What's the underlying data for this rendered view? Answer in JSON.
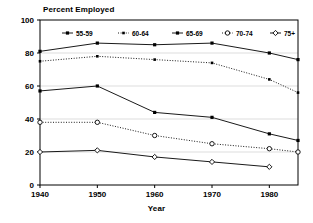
{
  "chart_data": {
    "type": "line",
    "title": "Percent Employed",
    "xlabel": "Year",
    "ylabel": "",
    "xlim": [
      1940,
      1985
    ],
    "ylim": [
      0,
      100
    ],
    "yticks": [
      0,
      20,
      40,
      60,
      80,
      100
    ],
    "xticks": [
      1940,
      1950,
      1960,
      1970,
      1980
    ],
    "grid": true,
    "legend_position": "top-inside",
    "x": [
      1940,
      1950,
      1960,
      1970,
      1980,
      1985
    ],
    "series": [
      {
        "name": "55-59",
        "marker": "filled-square",
        "linestyle": "solid",
        "color": "#000000",
        "values": [
          81,
          86,
          85,
          86,
          80,
          76
        ]
      },
      {
        "name": "60-64",
        "marker": "filled-square-small",
        "linestyle": "dotted",
        "color": "#000000",
        "values": [
          75,
          78,
          76,
          74,
          64,
          56
        ]
      },
      {
        "name": "65-69",
        "marker": "filled-square",
        "linestyle": "solid",
        "color": "#000000",
        "values": [
          57,
          60,
          44,
          41,
          31,
          27
        ]
      },
      {
        "name": "70-74",
        "marker": "open-circle",
        "linestyle": "dotted",
        "color": "#000000",
        "values": [
          38,
          38,
          30,
          25,
          22,
          20
        ]
      },
      {
        "name": "75+",
        "marker": "open-diamond",
        "linestyle": "solid",
        "color": "#000000",
        "values": [
          20,
          21,
          17,
          14,
          11,
          0
        ]
      }
    ]
  },
  "axis": {
    "y_tick_labels": [
      "0",
      "20",
      "40",
      "60",
      "80",
      "100"
    ],
    "x_tick_labels": [
      "1940",
      "1950",
      "1960",
      "1970",
      "1980"
    ],
    "x_title": "Year"
  },
  "legend": {
    "entries": [
      {
        "label": "55-59"
      },
      {
        "label": "60-64"
      },
      {
        "label": "65-69"
      },
      {
        "label": "70-74"
      },
      {
        "label": "75+"
      }
    ]
  }
}
